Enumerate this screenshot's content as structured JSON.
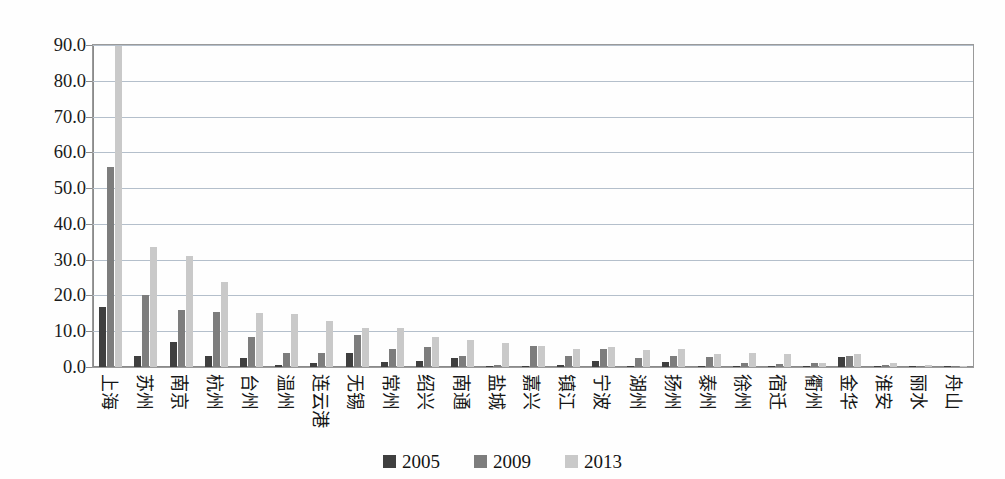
{
  "chart_data": {
    "type": "bar",
    "title": "",
    "subtitle": "",
    "xlabel": "",
    "ylabel": "",
    "ylim": [
      0,
      90
    ],
    "ytick_labels": [
      "90.0",
      "80.0",
      "70.0",
      "60.0",
      "50.0",
      "40.0",
      "30.0",
      "20.0",
      "10.0",
      "0.0"
    ],
    "ytick_values": [
      90,
      80,
      70,
      60,
      50,
      40,
      30,
      20,
      10,
      0
    ],
    "grid": true,
    "legend_position": "bottom",
    "categories": [
      "上海",
      "苏州",
      "南京",
      "杭州",
      "台州",
      "温州",
      "连云港",
      "无锡",
      "常州",
      "绍兴",
      "南通",
      "盐城",
      "嘉兴",
      "镇江",
      "宁波",
      "湖州",
      "扬州",
      "泰州",
      "徐州",
      "宿迁",
      "衢州",
      "金华",
      "淮安",
      "丽水",
      "舟山"
    ],
    "series": [
      {
        "name": "2005",
        "color": "#3f3f3f",
        "values": [
          16.8,
          3.0,
          7.0,
          3.0,
          2.5,
          0.5,
          1.2,
          4.0,
          1.5,
          1.8,
          2.5,
          0.3,
          0.4,
          0.5,
          1.8,
          0.3,
          1.5,
          0.3,
          0.2,
          0.2,
          0.3,
          2.8,
          0.3,
          0.1,
          0.1
        ]
      },
      {
        "name": "2009",
        "color": "#7d7d7d",
        "values": [
          55.8,
          20.1,
          16.0,
          15.5,
          8.5,
          4.0,
          4.0,
          9.0,
          5.0,
          5.5,
          3.0,
          0.6,
          6.0,
          3.0,
          5.0,
          2.5,
          3.0,
          2.8,
          1.0,
          0.8,
          1.0,
          3.2,
          0.7,
          0.3,
          0.2
        ]
      },
      {
        "name": "2013",
        "color": "#c9c9c9",
        "values": [
          89.8,
          33.5,
          31.0,
          23.8,
          15.0,
          14.8,
          13.0,
          11.0,
          11.0,
          8.5,
          7.5,
          6.8,
          6.0,
          5.0,
          5.5,
          4.8,
          5.0,
          3.5,
          3.8,
          3.5,
          1.2,
          3.5,
          1.0,
          0.5,
          0.3
        ]
      }
    ]
  },
  "legend": {
    "items": [
      {
        "label": "2005"
      },
      {
        "label": "2009"
      },
      {
        "label": "2013"
      }
    ]
  }
}
